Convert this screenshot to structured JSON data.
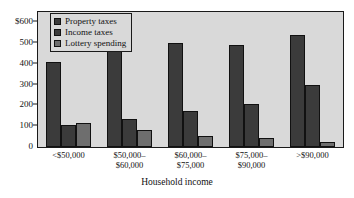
{
  "chart_data": {
    "type": "bar",
    "title": "",
    "xlabel": "Household income",
    "ylabel": "",
    "categories": [
      "<$50,000",
      "$50,000–$60,000",
      "$60,000–$75,000",
      "$75,000–$90,000",
      ">$90,000"
    ],
    "category_lines": [
      [
        "<$50,000"
      ],
      [
        "$50,000–",
        "$60,000"
      ],
      [
        "$60,000–",
        "$75,000"
      ],
      [
        "$75,000–",
        "$90,000"
      ],
      [
        ">$90,000"
      ]
    ],
    "series": [
      {
        "name": "Property taxes",
        "color": "#3b3b3b",
        "values": [
          410,
          500,
          500,
          490,
          540
        ]
      },
      {
        "name": "Income taxes",
        "color": "#3b3b3b",
        "values": [
          105,
          135,
          175,
          205,
          300
        ]
      },
      {
        "name": "Lottery spending",
        "color": "#6e6e6e",
        "values": [
          115,
          80,
          55,
          45,
          25
        ]
      }
    ],
    "ylim": [
      0,
      650
    ],
    "yticks": [
      0,
      100,
      200,
      300,
      400,
      500,
      600
    ],
    "ytick_labels": [
      "0",
      "100",
      "200",
      "300",
      "400",
      "500",
      "$600"
    ],
    "grid": false,
    "legend_position": "top-left",
    "plot_background": "#d9d9d9",
    "axis_color": "#1a1a1a"
  }
}
